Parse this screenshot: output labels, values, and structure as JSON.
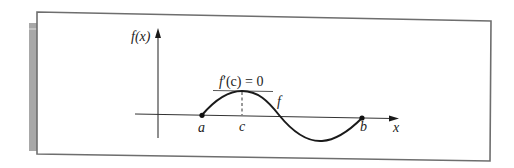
{
  "figure": {
    "labels": {
      "y_axis": "f(x)",
      "x_axis": "x",
      "point_a": "a",
      "point_b": "b",
      "point_c": "c",
      "curve": "f",
      "derivative_prefix": "f",
      "derivative_prime": "′",
      "derivative_arg": "(c)",
      "derivative_eq": " = 0"
    },
    "colors": {
      "frame": "#6e6e6e",
      "side_bar": "#a8a8a8",
      "axis": "#333333",
      "curve": "#1a1a1a",
      "text": "#222222"
    }
  }
}
